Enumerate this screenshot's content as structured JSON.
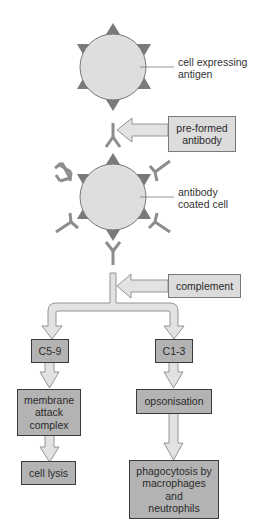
{
  "colors": {
    "cell_fill": "#dedede",
    "cell_stroke": "#777777",
    "antigen": "#7a7a7a",
    "antibody": "#8d8d8d",
    "arrow_fill": "#e2e2e2",
    "arrow_stroke": "#8a8a8a",
    "box_dark": "#b3b3b3",
    "box_light": "#dcdcdc"
  },
  "labels": {
    "cell_expressing_antigen": "cell expressing\nantigen",
    "antibody_coated_cell": "antibody\ncoated cell"
  },
  "inputs": {
    "preformed_antibody": "pre-formed\nantibody",
    "complement": "complement"
  },
  "pathways": {
    "left": {
      "step1": "C5-9",
      "step2": "membrane\nattack\ncomplex",
      "step3": "cell lysis"
    },
    "right": {
      "step1": "C1-3",
      "step2": "opsonisation",
      "step3": "phagocytosis by\nmacrophages\nand\nneutrophils"
    }
  }
}
